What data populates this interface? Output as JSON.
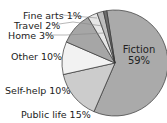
{
  "chart_data": {
    "type": "pie",
    "title": "",
    "categories": [
      "Fiction",
      "Public life",
      "Self-help",
      "Other",
      "Home",
      "Travel",
      "Fine arts"
    ],
    "values": [
      59,
      15,
      10,
      10,
      3,
      2,
      1
    ],
    "labels": {
      "fiction": "Fiction",
      "fiction_pct": "59%",
      "public_life": "Public life  15%",
      "self_help": "Self-help  10%",
      "other": "Other  10%",
      "home": "Home  3%",
      "travel": "Travel  2%",
      "fine_arts": "Fine arts  1%"
    },
    "colors": [
      "#aaaaaa",
      "#cccccc",
      "#f2f2f2",
      "#a6a6a6",
      "#e6e6e6",
      "#bdbdbd",
      "#6e6e6e"
    ],
    "start_angle_deg": -99,
    "center": [
      115,
      63
    ],
    "radius": 53,
    "legend": "none (direct labels)"
  }
}
